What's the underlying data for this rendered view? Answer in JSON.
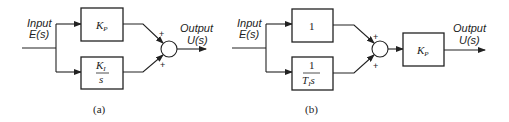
{
  "diagrams": [
    {
      "id": "a",
      "caption": "(a)",
      "input": {
        "line1": "Input",
        "line2": "E(s)"
      },
      "output": {
        "line1": "Output",
        "line2": "U(s)"
      },
      "blocks": [
        {
          "name": "proportional",
          "main": "K",
          "sub": "P"
        },
        {
          "name": "integral",
          "num_main": "K",
          "num_sub": "I",
          "den": "s"
        }
      ],
      "summing_junction": {
        "top_sign": "+",
        "bottom_sign": "+"
      }
    },
    {
      "id": "b",
      "caption": "(b)",
      "input": {
        "line1": "Input",
        "line2": "E(s)"
      },
      "output": {
        "line1": "Output",
        "line2": "U(s)"
      },
      "blocks": [
        {
          "name": "unity",
          "main": "1"
        },
        {
          "name": "integral",
          "num": "1",
          "den_main": "T",
          "den_sub": "I",
          "den_tail": "s"
        },
        {
          "name": "gain",
          "main": "K",
          "sub": "P"
        }
      ],
      "summing_junction": {
        "top_sign": "+",
        "bottom_sign": "+"
      }
    }
  ]
}
